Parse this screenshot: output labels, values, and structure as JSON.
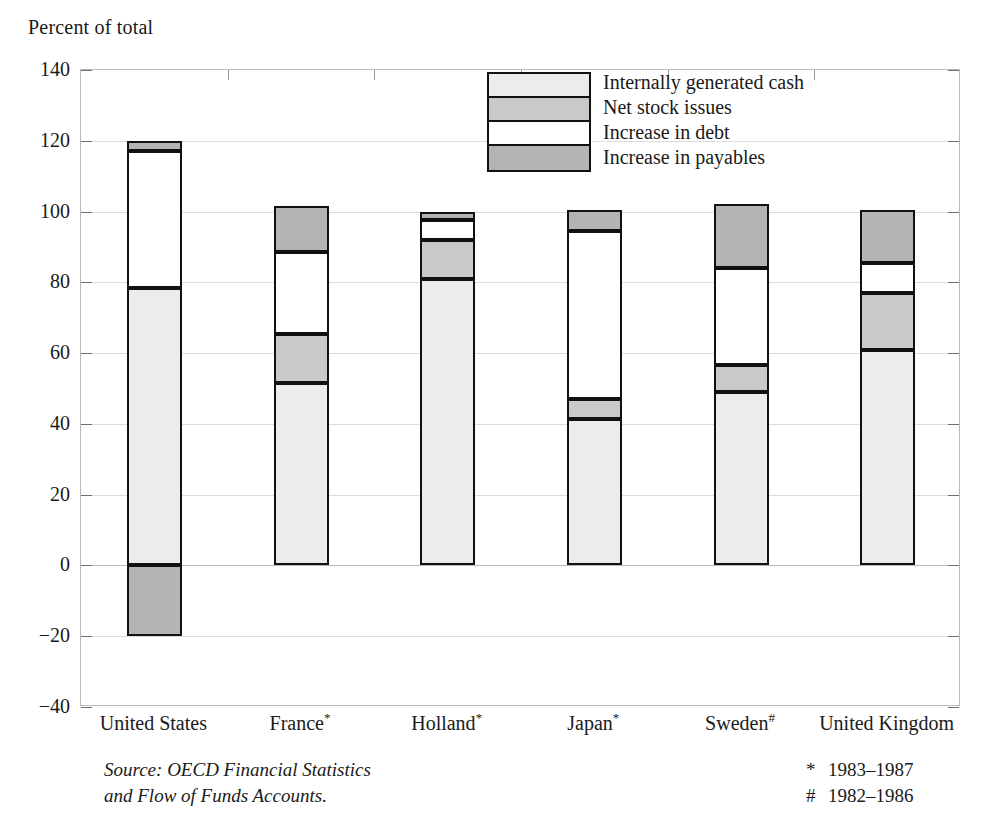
{
  "chart_data": {
    "type": "bar",
    "subtype": "stacked-bar",
    "title": "Percent of total",
    "ylabel": "Percent of total",
    "xlabel": "",
    "ylim": [
      -40,
      140
    ],
    "ytick_step": 20,
    "ytick_labels": [
      "140",
      "120",
      "100",
      "80",
      "60",
      "40",
      "20",
      "0",
      "−20",
      "−40"
    ],
    "ytick_values": [
      140,
      120,
      100,
      80,
      60,
      40,
      20,
      0,
      -20,
      -40
    ],
    "grid": true,
    "legend_position": "inside-top-center",
    "categories": [
      "United States",
      "France*",
      "Holland*",
      "Japan*",
      "Sweden#",
      "United Kingdom"
    ],
    "category_names": [
      "United States",
      "France",
      "Holland",
      "Japan",
      "Sweden",
      "United Kingdom"
    ],
    "category_marks": [
      "",
      "*",
      "*",
      "*",
      "#",
      ""
    ],
    "series": [
      {
        "name": "Internally generated cash",
        "key": "cash",
        "color": "#ececec",
        "values": [
          78.5,
          51.5,
          81.0,
          41.5,
          49.0,
          61.0
        ]
      },
      {
        "name": "Net stock issues",
        "key": "stock",
        "color": "#c9c9c9",
        "values": [
          0.0,
          14.0,
          11.0,
          5.5,
          7.5,
          16.0
        ]
      },
      {
        "name": "Increase in debt",
        "key": "debt",
        "color": "#ffffff",
        "values": [
          38.5,
          23.0,
          5.5,
          47.5,
          27.5,
          8.5
        ]
      },
      {
        "name": "Increase in payables",
        "key": "payables",
        "color": "#b4b4b4",
        "values": [
          3.0,
          13.0,
          2.5,
          6.0,
          18.0,
          15.0
        ]
      }
    ],
    "negative_segments": [
      {
        "category": "United States",
        "series": "Increase in payables",
        "value": -20.0
      }
    ],
    "bar_totals": [
      120.0,
      101.5,
      100.0,
      100.5,
      102.0,
      100.5
    ]
  },
  "legend": {
    "items": [
      {
        "label": "Internally generated cash",
        "swatch": "#ececec"
      },
      {
        "label": "Net stock issues",
        "swatch": "#c9c9c9"
      },
      {
        "label": "Increase in debt",
        "swatch": "#ffffff"
      },
      {
        "label": "Increase in payables",
        "swatch": "#b4b4b4"
      }
    ]
  },
  "footer": {
    "source_line_1": "Source: OECD Financial Statistics",
    "source_line_2": "and Flow of Funds Accounts.",
    "footnotes": [
      {
        "mark": "*",
        "text": "1983–1987"
      },
      {
        "mark": "#",
        "text": "1982–1986"
      }
    ]
  }
}
